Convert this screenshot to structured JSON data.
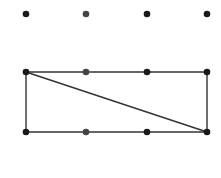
{
  "diagram": {
    "colors": {
      "dot": "#1a1a1a",
      "dot_alt": "#444444",
      "line": "#333333",
      "background": "#ffffff"
    },
    "columns_x": [
      26,
      86,
      147,
      207
    ],
    "rows_y": [
      14,
      72,
      132
    ],
    "dots": [
      {
        "row": 0,
        "col": 0
      },
      {
        "row": 0,
        "col": 1
      },
      {
        "row": 0,
        "col": 2
      },
      {
        "row": 0,
        "col": 3
      },
      {
        "row": 1,
        "col": 0
      },
      {
        "row": 1,
        "col": 1
      },
      {
        "row": 1,
        "col": 2
      },
      {
        "row": 1,
        "col": 3
      },
      {
        "row": 2,
        "col": 0
      },
      {
        "row": 2,
        "col": 1
      },
      {
        "row": 2,
        "col": 2
      },
      {
        "row": 2,
        "col": 3
      }
    ],
    "segments": [
      {
        "from": [
          1,
          0
        ],
        "to": [
          1,
          3
        ]
      },
      {
        "from": [
          2,
          0
        ],
        "to": [
          2,
          3
        ]
      },
      {
        "from": [
          1,
          0
        ],
        "to": [
          2,
          0
        ]
      },
      {
        "from": [
          1,
          3
        ],
        "to": [
          2,
          3
        ]
      },
      {
        "from": [
          1,
          0
        ],
        "to": [
          2,
          3
        ]
      }
    ]
  }
}
